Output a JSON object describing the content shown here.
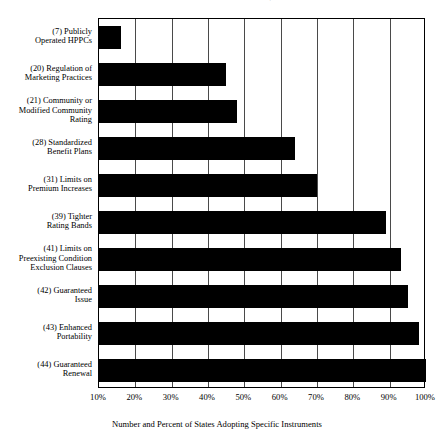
{
  "chart_data": {
    "type": "bar",
    "orientation": "horizontal",
    "title": "in State Health Insurance Reforms, 1990–1995",
    "caption": "Number and Percent of States Adopting Specific Instruments",
    "xlabel": "",
    "ylabel": "",
    "xlim": [
      10,
      100
    ],
    "grid": true,
    "legend": null,
    "bar_color": "#000000",
    "xticks": [
      "10%",
      "20%",
      "30%",
      "40%",
      "50%",
      "60%",
      "70%",
      "80%",
      "90%",
      "100%"
    ],
    "xtick_values": [
      10,
      20,
      30,
      40,
      50,
      60,
      70,
      80,
      90,
      100
    ],
    "categories": [
      "(7) Publicly Operated HPPCs",
      "(20) Regulation of Marketing Practices",
      "(21) Community or Modified Community Rating",
      "(28) Standardized Benefit Plans",
      "(31) Limits on Premium Increases",
      "(39) Tighter Rating Bands",
      "(41) Limits on Preexisting Condition Exclusion Clauses",
      "(42) Guaranteed Issue",
      "(43) Enhanced Portability",
      "(44) Guaranteed Renewal"
    ],
    "counts": [
      7,
      20,
      21,
      28,
      31,
      39,
      41,
      42,
      43,
      44
    ],
    "values": [
      16,
      45,
      48,
      64,
      70,
      89,
      93,
      95,
      98,
      100
    ],
    "total_states": 44
  },
  "labels": [
    {
      "lines": [
        "(7) Publicly",
        "Operated HPPCs"
      ]
    },
    {
      "lines": [
        "(20) Regulation of",
        "Marketing Practices"
      ]
    },
    {
      "lines": [
        "(21) Community or",
        "Modified Community",
        "Rating"
      ]
    },
    {
      "lines": [
        "(28) Standardized",
        "Benefit Plans"
      ]
    },
    {
      "lines": [
        "(31) Limits on",
        "Premium Increases"
      ]
    },
    {
      "lines": [
        "(39) Tighter",
        "Rating Bands"
      ]
    },
    {
      "lines": [
        "(41) Limits on",
        "Preexisting Condition",
        "Exclusion Clauses"
      ]
    },
    {
      "lines": [
        "(42) Guaranteed",
        "Issue"
      ]
    },
    {
      "lines": [
        "(43) Enhanced",
        "Portability"
      ]
    },
    {
      "lines": [
        "(44) Guaranteed",
        "Renewal"
      ]
    }
  ]
}
